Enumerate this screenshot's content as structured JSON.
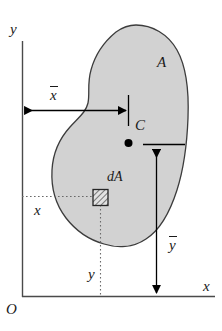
{
  "figure": {
    "kind": "centroid-of-an-area-diagram",
    "axes": {
      "y_axis_label": "y",
      "x_axis_label": "x",
      "origin_label": "O"
    },
    "region": {
      "area_label": "A",
      "fill_color": "#d2d2d2",
      "stroke_color": "#3c3c3c"
    },
    "centroid": {
      "point_label": "C",
      "dot_color": "#000000"
    },
    "element": {
      "label": "dA",
      "hatch_color": "#555555"
    },
    "dimensions": {
      "xbar_label": "x",
      "xbar_overbar": true,
      "ybar_label": "y",
      "ybar_overbar": true,
      "x_label": "x",
      "y_label": "y"
    }
  }
}
